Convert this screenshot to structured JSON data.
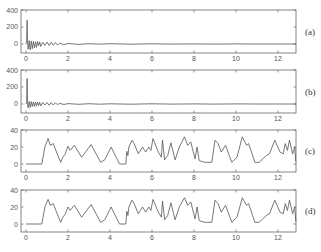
{
  "chart_data": [
    {
      "id": "a",
      "type": "line",
      "panel_label": "(a)",
      "title": "",
      "xlabel": "",
      "ylabel": "",
      "xlim": [
        -0.24,
        12.86
      ],
      "ylim": [
        -106,
        400
      ],
      "xticks": [
        0,
        2,
        4,
        6,
        8,
        10,
        12
      ],
      "yticks": [
        0,
        200,
        400
      ],
      "grid": false,
      "series": [
        {
          "name": "signal-a",
          "x": [
            0,
            0.03,
            0.05,
            0.07,
            0.1,
            0.15,
            0.2,
            0.25,
            0.3,
            0.35,
            0.4,
            0.45,
            0.5,
            0.55,
            0.6,
            0.65,
            0.7,
            0.8,
            0.9,
            1.0,
            1.1,
            1.2,
            1.3,
            1.4,
            1.5,
            1.6,
            1.8,
            2.0,
            2.5,
            3.0,
            3.5,
            4.0,
            5.0,
            6.0,
            7.0,
            8.0,
            9.0,
            10.0,
            11.0,
            12.0,
            12.86
          ],
          "y": [
            0,
            40,
            280,
            20,
            -60,
            40,
            -70,
            35,
            -55,
            30,
            -45,
            25,
            -40,
            30,
            -20,
            25,
            -30,
            20,
            -15,
            22,
            -18,
            20,
            -15,
            18,
            -12,
            10,
            -8,
            6,
            -5,
            4,
            -3,
            3,
            -2,
            2,
            -1,
            1,
            -1,
            1,
            0,
            0,
            0
          ]
        }
      ]
    },
    {
      "id": "b",
      "type": "line",
      "panel_label": "(b)",
      "title": "",
      "xlabel": "",
      "ylabel": "",
      "xlim": [
        -0.24,
        12.86
      ],
      "ylim": [
        -106,
        400
      ],
      "xticks": [
        0,
        2,
        4,
        6,
        8,
        10,
        12
      ],
      "yticks": [
        0,
        200,
        400
      ],
      "grid": false,
      "series": [
        {
          "name": "signal-b",
          "x": [
            0,
            0.03,
            0.05,
            0.07,
            0.1,
            0.15,
            0.2,
            0.25,
            0.3,
            0.35,
            0.4,
            0.45,
            0.5,
            0.55,
            0.6,
            0.65,
            0.7,
            0.8,
            0.9,
            1.0,
            1.1,
            1.2,
            1.3,
            1.4,
            1.5,
            1.6,
            1.8,
            2.0,
            2.5,
            3.0,
            3.5,
            4.0,
            5.0,
            6.0,
            7.0,
            8.0,
            9.0,
            10.0,
            11.0,
            12.0,
            12.86
          ],
          "y": [
            0,
            30,
            300,
            15,
            -45,
            30,
            -40,
            28,
            -30,
            25,
            -28,
            22,
            -25,
            24,
            -18,
            20,
            -22,
            18,
            -12,
            18,
            -14,
            16,
            -12,
            15,
            -10,
            8,
            -6,
            5,
            -4,
            3,
            -3,
            2,
            -2,
            2,
            -1,
            1,
            -1,
            1,
            0,
            0,
            0
          ]
        }
      ]
    },
    {
      "id": "c",
      "type": "line",
      "panel_label": "(c)",
      "title": "",
      "xlabel": "",
      "ylabel": "",
      "xlim": [
        -0.24,
        12.86
      ],
      "ylim": [
        -9.4,
        40
      ],
      "xticks": [
        0,
        2,
        4,
        6,
        8,
        10,
        12
      ],
      "yticks": [
        0,
        20,
        40
      ],
      "grid": false,
      "series": [
        {
          "name": "envelope-c",
          "x": [
            0,
            0.75,
            0.9,
            1.05,
            1.15,
            1.3,
            1.45,
            1.65,
            1.75,
            1.85,
            2.0,
            2.1,
            2.3,
            2.65,
            3.1,
            3.55,
            3.75,
            4.05,
            4.45,
            4.75,
            4.8,
            4.85,
            4.9,
            5.05,
            5.15,
            5.35,
            5.55,
            5.7,
            5.85,
            5.95,
            6.05,
            6.3,
            6.45,
            6.5,
            6.6,
            6.75,
            6.9,
            7.1,
            7.3,
            7.55,
            7.7,
            7.85,
            8.05,
            8.15,
            8.25,
            8.5,
            8.85,
            9.0,
            9.15,
            9.3,
            9.5,
            9.8,
            10.05,
            10.3,
            10.5,
            10.6,
            10.9,
            11.1,
            11.45,
            11.6,
            11.85,
            12.1,
            12.25,
            12.35,
            12.45,
            12.55,
            12.7,
            12.8,
            12.85
          ],
          "y": [
            0,
            0,
            20,
            30,
            22,
            24,
            14,
            2,
            8,
            11,
            21,
            16,
            22,
            8,
            23,
            2,
            5,
            20,
            0,
            0,
            15,
            10,
            20,
            28,
            24,
            12,
            20,
            14,
            20,
            16,
            30,
            14,
            8,
            28,
            5,
            10,
            25,
            5,
            20,
            32,
            22,
            26,
            6,
            20,
            4,
            2,
            2,
            28,
            24,
            14,
            22,
            2,
            8,
            32,
            22,
            24,
            2,
            2,
            10,
            12,
            28,
            14,
            12,
            24,
            16,
            28,
            12,
            20,
            3
          ]
        }
      ]
    },
    {
      "id": "d",
      "type": "line",
      "panel_label": "(d)",
      "title": "",
      "xlabel": "",
      "ylabel": "",
      "xlim": [
        -0.24,
        12.86
      ],
      "ylim": [
        -9.4,
        40
      ],
      "xticks": [
        0,
        2,
        4,
        6,
        8,
        10,
        12
      ],
      "yticks": [
        0,
        20,
        40
      ],
      "grid": false,
      "series": [
        {
          "name": "envelope-d",
          "x": [
            0,
            0.75,
            0.9,
            1.05,
            1.15,
            1.3,
            1.45,
            1.65,
            1.75,
            1.85,
            2.0,
            2.1,
            2.3,
            2.65,
            3.1,
            3.55,
            3.75,
            4.05,
            4.45,
            4.75,
            4.8,
            4.85,
            4.9,
            5.05,
            5.15,
            5.35,
            5.55,
            5.7,
            5.85,
            5.95,
            6.05,
            6.3,
            6.45,
            6.5,
            6.6,
            6.75,
            6.9,
            7.1,
            7.3,
            7.55,
            7.7,
            7.85,
            8.05,
            8.15,
            8.25,
            8.5,
            8.85,
            9.0,
            9.15,
            9.3,
            9.5,
            9.8,
            10.05,
            10.3,
            10.5,
            10.6,
            10.9,
            11.1,
            11.45,
            11.6,
            11.85,
            12.1,
            12.25,
            12.35,
            12.45,
            12.55,
            12.7,
            12.8,
            12.85
          ],
          "y": [
            0,
            0,
            20,
            29,
            22,
            24,
            14,
            2,
            8,
            11,
            20,
            16,
            22,
            8,
            23,
            2,
            5,
            20,
            0,
            0,
            15,
            10,
            20,
            28,
            24,
            12,
            20,
            14,
            20,
            16,
            29,
            14,
            8,
            27,
            5,
            10,
            25,
            5,
            20,
            31,
            22,
            26,
            6,
            20,
            4,
            2,
            2,
            28,
            24,
            14,
            22,
            2,
            8,
            31,
            22,
            24,
            2,
            2,
            10,
            12,
            28,
            14,
            12,
            24,
            16,
            28,
            12,
            20,
            3
          ]
        }
      ]
    }
  ],
  "colors": {
    "axis": "#666666",
    "line": "#555555",
    "text": "#555555"
  }
}
